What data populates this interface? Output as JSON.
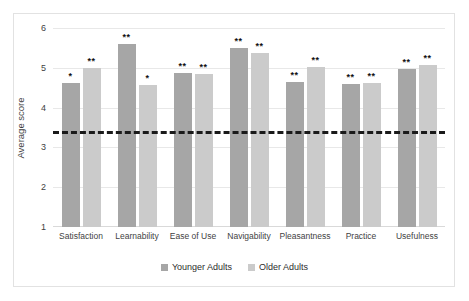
{
  "chart_data": {
    "type": "bar",
    "title": "",
    "xlabel": "",
    "ylabel": "Average score",
    "ylim": [
      1,
      6
    ],
    "yticks": [
      1,
      2,
      3,
      4,
      5,
      6
    ],
    "grid": true,
    "legend_position": "bottom",
    "categories": [
      "Satisfaction",
      "Learnability",
      "Ease of Use",
      "Navigability",
      "Pleasantness",
      "Practice",
      "Usefulness"
    ],
    "series": [
      {
        "name": "Younger Adults",
        "color": "#a6a6a6",
        "values": [
          4.63,
          5.6,
          4.88,
          5.5,
          4.65,
          4.6,
          4.98
        ],
        "annotations": [
          "*",
          "**",
          "**",
          "**",
          "**",
          "**",
          "**"
        ]
      },
      {
        "name": "Older Adults",
        "color": "#cbcbcb",
        "values": [
          5.0,
          4.58,
          4.85,
          5.38,
          5.02,
          4.62,
          5.08
        ],
        "annotations": [
          "**",
          "*",
          "**",
          "**",
          "**",
          "**",
          "**"
        ]
      }
    ],
    "reference_line": {
      "value": 3.4,
      "style": "dashed",
      "color": "#1a1a1a"
    }
  },
  "legend": {
    "items": [
      {
        "label": "Younger Adults",
        "color": "#a6a6a6"
      },
      {
        "label": "Older Adults",
        "color": "#cbcbcb"
      }
    ]
  }
}
